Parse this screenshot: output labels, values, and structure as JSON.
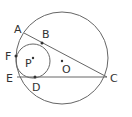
{
  "labels": {
    "A": "A",
    "B": "B",
    "C": "C",
    "D": "D",
    "E": "E",
    "F": "F",
    "P": "P",
    "O": "O"
  },
  "stroke_color": "#555555"
}
